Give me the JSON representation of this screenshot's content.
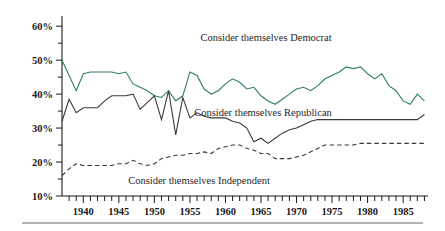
{
  "figure": {
    "background": "#ffffff",
    "bottom_rule_color": "#6b6b6b"
  },
  "annotations": {
    "democrat_label": "Consider themselves Democrat",
    "republican_label": "Consider themselves Republican",
    "independent_label": "Consider themselves Independent"
  },
  "chart_data": {
    "type": "line",
    "title": "",
    "subtitle": "",
    "xlabel": "",
    "ylabel": "",
    "xlim": [
      1937,
      1988.5
    ],
    "ylim": [
      10,
      63
    ],
    "grid": false,
    "legend": "inline-annotations",
    "y_ticks_major": [
      10,
      20,
      30,
      40,
      50,
      60
    ],
    "y_tick_labels": [
      "10%",
      "20%",
      "30%",
      "40%",
      "50%",
      "60%"
    ],
    "y_ticks_minor": [
      15,
      25,
      35,
      45,
      55
    ],
    "x_tick_labels": [
      "1940",
      "1945",
      "1950",
      "1955",
      "1960",
      "1965",
      "1970",
      "1975",
      "1980",
      "1985"
    ],
    "x_ticks_labeled": [
      1940,
      1945,
      1950,
      1955,
      1960,
      1965,
      1970,
      1975,
      1980,
      1985
    ],
    "x_tick_step": 1,
    "x_tick_start": 1938,
    "x_tick_end": 1988,
    "series": [
      {
        "name": "Consider themselves Democrat",
        "color": "#2e7d64",
        "style": "solid",
        "width": 1.1,
        "x": [
          1937,
          1938,
          1939,
          1940,
          1941,
          1942,
          1943,
          1944,
          1945,
          1946,
          1947,
          1948,
          1949,
          1950,
          1951,
          1952,
          1953,
          1954,
          1955,
          1956,
          1957,
          1958,
          1959,
          1960,
          1961,
          1962,
          1963,
          1964,
          1965,
          1966,
          1967,
          1968,
          1969,
          1970,
          1971,
          1972,
          1973,
          1974,
          1975,
          1976,
          1977,
          1978,
          1979,
          1980,
          1981,
          1982,
          1983,
          1984,
          1985,
          1986,
          1987,
          1988
        ],
        "values": [
          50,
          45.5,
          41,
          46,
          46.5,
          46.5,
          46.5,
          46.5,
          46,
          46.5,
          43,
          42,
          41,
          39.5,
          39,
          41,
          38,
          39.5,
          46.5,
          45.5,
          41.5,
          40,
          41,
          43,
          44.5,
          43.5,
          41.5,
          42,
          39.5,
          38,
          37,
          38.5,
          40,
          41.5,
          42,
          41,
          42.5,
          44.5,
          45.5,
          46.5,
          48,
          47.5,
          48,
          46,
          44.5,
          46,
          42.5,
          41,
          38,
          37,
          40,
          38
        ]
      },
      {
        "name": "Consider themselves Republican",
        "color": "#3a3a3a",
        "style": "solid",
        "width": 1.1,
        "x": [
          1937,
          1938,
          1939,
          1940,
          1941,
          1942,
          1943,
          1944,
          1945,
          1946,
          1947,
          1948,
          1949,
          1950,
          1951,
          1952,
          1953,
          1954,
          1955,
          1956,
          1957,
          1958,
          1959,
          1960,
          1961,
          1962,
          1963,
          1964,
          1965,
          1966,
          1967,
          1968,
          1969,
          1970,
          1971,
          1972,
          1973,
          1974,
          1975,
          1976,
          1977,
          1978,
          1979,
          1980,
          1981,
          1982,
          1983,
          1984,
          1985,
          1986,
          1987,
          1988
        ],
        "values": [
          32,
          38.5,
          34.5,
          36,
          36,
          36,
          38,
          39.5,
          39.5,
          39.5,
          40,
          35.5,
          37.5,
          39.5,
          32.5,
          41,
          28,
          39,
          33,
          34.5,
          33.5,
          33,
          33,
          33,
          32,
          31.5,
          30,
          26,
          27,
          25.5,
          27,
          28.5,
          29.5,
          30,
          31,
          32,
          32.5,
          32.5,
          32.5,
          32.5,
          32.5,
          32.5,
          32.5,
          32.5,
          32.5,
          32.5,
          32.5,
          32.5,
          32.5,
          32.5,
          32.5,
          34
        ]
      },
      {
        "name": "Consider themselves Independent",
        "color": "#3a3a3a",
        "style": "dashed",
        "width": 1.1,
        "x": [
          1937,
          1938,
          1939,
          1940,
          1941,
          1942,
          1943,
          1944,
          1945,
          1946,
          1947,
          1948,
          1949,
          1950,
          1951,
          1952,
          1953,
          1954,
          1955,
          1956,
          1957,
          1958,
          1959,
          1960,
          1961,
          1962,
          1963,
          1964,
          1965,
          1966,
          1967,
          1968,
          1969,
          1970,
          1971,
          1972,
          1973,
          1974,
          1975,
          1976,
          1977,
          1978,
          1979,
          1980,
          1981,
          1982,
          1983,
          1984,
          1985,
          1986,
          1987,
          1988
        ],
        "values": [
          16,
          18,
          19.5,
          19,
          19,
          19,
          19,
          19,
          19.5,
          19.5,
          20.5,
          19.5,
          19,
          19.5,
          21,
          21.5,
          22,
          22,
          22.5,
          22.5,
          23,
          22.5,
          24,
          24.5,
          25,
          25,
          24,
          23.5,
          22.5,
          22.5,
          21,
          21,
          21,
          21.5,
          22,
          23,
          24,
          25,
          25,
          25,
          25,
          25,
          25.5,
          25.5,
          25.5,
          25.5,
          25.5,
          25.5,
          25.5,
          25.5,
          25.5,
          25.5
        ]
      }
    ]
  }
}
